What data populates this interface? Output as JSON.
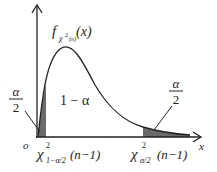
{
  "figure": {
    "function_label": {
      "f": "f",
      "subscript_chi": "χ",
      "subscript_sup": "2",
      "subscript_n": "(n)",
      "arg": "(x)"
    },
    "origin_label": "o",
    "x_axis_label": "x",
    "center_area_label": "1 − α",
    "left_tail_label": {
      "numerator": "α",
      "denominator": "2"
    },
    "right_tail_label": {
      "numerator": "α",
      "denominator": "2"
    },
    "left_quantile": {
      "chi": "χ",
      "sup": "2",
      "sub": "1−α/2",
      "arg": "(n−1)"
    },
    "right_quantile": {
      "chi": "χ",
      "sup": "2",
      "sub": "α/2",
      "arg": "(n−1)"
    },
    "colors": {
      "stroke": "#222222",
      "shade": "#6b6b6b",
      "background": "#ffffff"
    }
  }
}
